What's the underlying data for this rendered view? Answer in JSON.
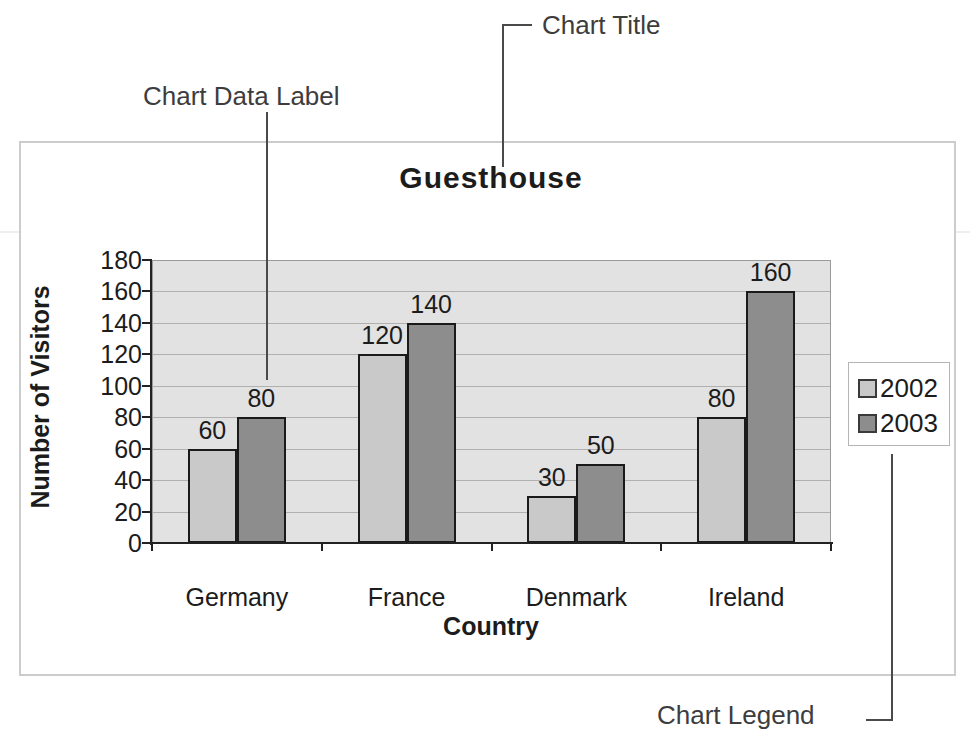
{
  "annotations": {
    "chart_title": "Chart Title",
    "chart_data_label": "Chart Data Label",
    "chart_legend": "Chart Legend"
  },
  "chart_data": {
    "type": "bar",
    "title": "Guesthouse",
    "xlabel": "Country",
    "ylabel": "Number of Visitors",
    "categories": [
      "Germany",
      "France",
      "Denmark",
      "Ireland"
    ],
    "series": [
      {
        "name": "2002",
        "values": [
          60,
          120,
          30,
          80
        ],
        "color": "#c9c9c9"
      },
      {
        "name": "2003",
        "values": [
          80,
          140,
          50,
          160
        ],
        "color": "#8d8d8d"
      }
    ],
    "ylim": [
      0,
      180
    ],
    "ytick_step": 20,
    "grid": true,
    "legend_position": "right",
    "data_labels": true
  },
  "colors": {
    "plot_bg": "#e2e2e2",
    "gridline": "#b0b0b0",
    "axis": "#222222",
    "bar_border": "#1a1a1a",
    "frame_border": "#cccccc",
    "annotation_line": "#4a4a4a"
  }
}
